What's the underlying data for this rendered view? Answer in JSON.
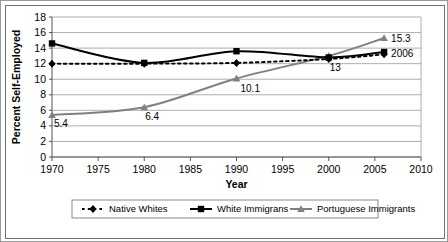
{
  "chart_data": {
    "type": "line",
    "title": "",
    "xlabel": "Year",
    "ylabel": "Percent Self-Employed",
    "x": [
      1970,
      1980,
      1990,
      2000,
      2006
    ],
    "xlim": [
      1970,
      2010
    ],
    "ylim": [
      0,
      18
    ],
    "xticks": [
      "1970",
      "1975",
      "1980",
      "1985",
      "1990",
      "1995",
      "2000",
      "2005",
      "2010"
    ],
    "yticks": [
      "0",
      "2",
      "4",
      "6",
      "8",
      "10",
      "12",
      "14",
      "16",
      "18"
    ],
    "grid": "horizontal",
    "legend_position": "bottom",
    "series": [
      {
        "name": "Native Whites",
        "values": [
          12.0,
          12.0,
          12.1,
          12.6,
          13.2
        ],
        "color": "#000000",
        "style": "dashed",
        "marker": "diamond"
      },
      {
        "name": "White Immigrans",
        "values": [
          14.6,
          12.1,
          13.6,
          12.8,
          13.5
        ],
        "color": "#000000",
        "style": "solid",
        "marker": "square"
      },
      {
        "name": "Portuguese Immigrants",
        "values": [
          5.4,
          6.4,
          10.1,
          13.0,
          15.3
        ],
        "color": "#808080",
        "style": "solid",
        "marker": "triangle"
      }
    ],
    "annotations": [
      {
        "text": "5.4",
        "x": 1970,
        "y": 5.4
      },
      {
        "text": "6.4",
        "x": 1980,
        "y": 6.4
      },
      {
        "text": "10.1",
        "x": 1990,
        "y": 10.1
      },
      {
        "text": "13",
        "x": 2000,
        "y": 13.0
      },
      {
        "text": "15.3",
        "x": 2006,
        "y": 15.3
      },
      {
        "text": "2006",
        "x": 2006,
        "y": 13.5
      }
    ]
  },
  "legend": {
    "items": [
      {
        "label": "Native Whites"
      },
      {
        "label": "White Immigrans"
      },
      {
        "label": "Portuguese Immigrants"
      }
    ]
  }
}
